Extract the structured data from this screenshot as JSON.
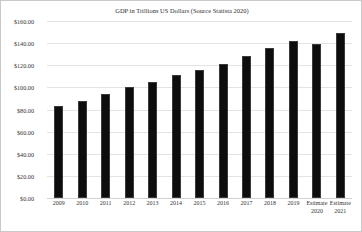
{
  "chart_data": {
    "type": "bar",
    "title": "GDP in Trillions US Dollars (Source Statista 2020)",
    "xlabel": "",
    "ylabel": "",
    "ylim": [
      0,
      160
    ],
    "grid": true,
    "legend": "none",
    "bar_color": "#0d0d0d",
    "gridline_color": "#e3e3e3",
    "categories": [
      "2009",
      "2010",
      "2011",
      "2012",
      "2013",
      "2014",
      "2015",
      "2016",
      "2017",
      "2018",
      "2019",
      "Estimate 2020",
      "Estimate 2021"
    ],
    "category_lines": [
      [
        "2009"
      ],
      [
        "2010"
      ],
      [
        "2011"
      ],
      [
        "2012"
      ],
      [
        "2013"
      ],
      [
        "2014"
      ],
      [
        "2015"
      ],
      [
        "2016"
      ],
      [
        "2017"
      ],
      [
        "2018"
      ],
      [
        "2019"
      ],
      [
        "Estimate",
        "2020"
      ],
      [
        "Estimate",
        "2021"
      ]
    ],
    "values": [
      83,
      88,
      94,
      100,
      105,
      111,
      116,
      121,
      128,
      136,
      142,
      139,
      149
    ],
    "ytick_values": [
      0,
      20,
      40,
      60,
      80,
      100,
      120,
      140,
      160
    ],
    "ytick_labels": [
      "$0.00",
      "$20.00",
      "$40.00",
      "$60.00",
      "$80.00",
      "$100.00",
      "$120.00",
      "$140.00",
      "$160.00"
    ]
  }
}
